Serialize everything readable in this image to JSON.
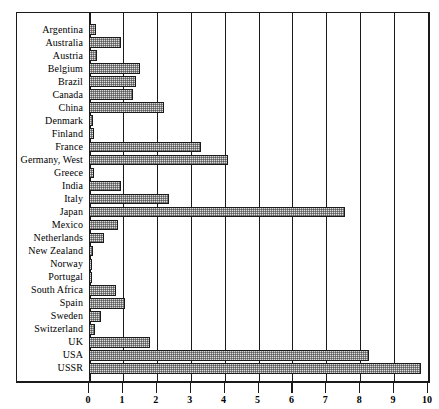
{
  "chart_data": {
    "type": "bar",
    "orientation": "horizontal",
    "title": "",
    "subtitle": "",
    "xlabel": "",
    "ylabel": "",
    "xlim": [
      0,
      10
    ],
    "grid": true,
    "legend": null,
    "xticks": [
      "0",
      "1",
      "2",
      "3",
      "4",
      "5",
      "6",
      "7",
      "8",
      "9",
      "10"
    ],
    "categories": [
      "Argentina",
      "Australia",
      "Austria",
      "Belgium",
      "Brazil",
      "Canada",
      "China",
      "Denmark",
      "Finland",
      "France",
      "Germany, West",
      "Greece",
      "India",
      "Italy",
      "Japan",
      "Mexico",
      "Netherlands",
      "New Zealand",
      "Norway",
      "Portugal",
      "South Africa",
      "Spain",
      "Sweden",
      "Switzerland",
      "UK",
      "USA",
      "USSR"
    ],
    "values": [
      0.2,
      0.95,
      0.25,
      1.5,
      1.4,
      1.3,
      2.2,
      0.12,
      0.15,
      3.3,
      4.1,
      0.15,
      0.95,
      2.35,
      7.55,
      0.85,
      0.45,
      0.12,
      0.1,
      0.08,
      0.8,
      1.05,
      0.35,
      0.18,
      1.8,
      8.25,
      9.8
    ]
  },
  "style": {
    "bar_fill": "#dcdcdc",
    "bar_edge": "#1a1a1a",
    "frame_color": "#1a1a1a",
    "background": "#ffffff"
  }
}
